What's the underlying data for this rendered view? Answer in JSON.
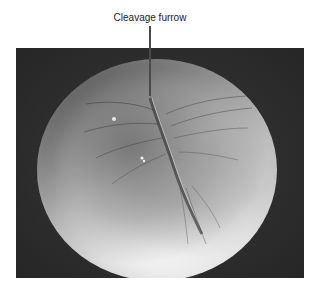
{
  "figure": {
    "annotation_label": "Cleavage furrow",
    "colors": {
      "background": "#ffffff",
      "photo_background": "#2d2d2d",
      "cell_highlight": "#f0f0f0",
      "cell_shadow": "#5a5a5a",
      "leader_line": "#4a4a4a"
    }
  }
}
